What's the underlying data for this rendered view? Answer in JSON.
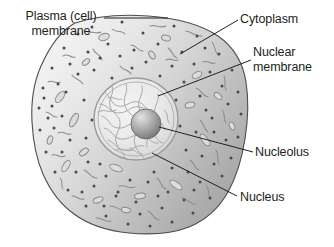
{
  "figure": {
    "background_color": "#ffffff",
    "text_color": "#231f20",
    "line_color": "#231f20"
  },
  "labels": {
    "plasma_membrane": {
      "line1": "Plasma (cell)",
      "line2": "membrane",
      "icon": "leader-line-icon"
    },
    "cytoplasm": {
      "line1": "Cytoplasm",
      "icon": "leader-line-icon"
    },
    "nuclear_membrane": {
      "line1": "Nuclear",
      "line2": "membrane",
      "icon": "leader-line-icon"
    },
    "nucleolus": {
      "line1": "Nucleolus",
      "icon": "leader-line-icon"
    },
    "nucleus": {
      "line1": "Nucleus",
      "icon": "leader-line-icon"
    }
  },
  "structures": {
    "cytoplasm_fill_light": "#eeeeee",
    "cytoplasm_fill_dark": "#a6a6a6",
    "membrane_stroke": "#555555",
    "nucleus_fill": "#e8e8e8",
    "nucleus_stroke": "#8d8d8d",
    "chromatin_stroke": "#a9a9a9",
    "nucleolus_light": "#d8d8d8",
    "nucleolus_dark": "#6e6e6e",
    "organelle_stroke": "#8a8a8a",
    "granule_fill": "#4f4f4f"
  }
}
